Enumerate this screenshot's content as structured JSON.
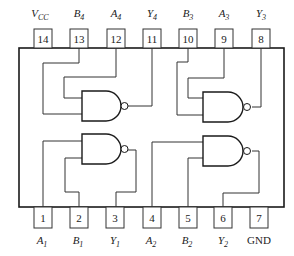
{
  "diagram": {
    "type": "IC pinout",
    "top_pins": [
      {
        "num": "14",
        "label": "V",
        "sub": "CC",
        "italic": true
      },
      {
        "num": "13",
        "label": "B",
        "sub": "4",
        "italic": true
      },
      {
        "num": "12",
        "label": "A",
        "sub": "4",
        "italic": true
      },
      {
        "num": "11",
        "label": "Y",
        "sub": "4",
        "italic": true
      },
      {
        "num": "10",
        "label": "B",
        "sub": "3",
        "italic": true
      },
      {
        "num": "9",
        "label": "A",
        "sub": "3",
        "italic": true
      },
      {
        "num": "8",
        "label": "Y",
        "sub": "3",
        "italic": true
      }
    ],
    "bottom_pins": [
      {
        "num": "1",
        "label": "A",
        "sub": "1",
        "italic": true
      },
      {
        "num": "2",
        "label": "B",
        "sub": "1",
        "italic": true
      },
      {
        "num": "3",
        "label": "Y",
        "sub": "1",
        "italic": true
      },
      {
        "num": "4",
        "label": "A",
        "sub": "2",
        "italic": true
      },
      {
        "num": "5",
        "label": "B",
        "sub": "2",
        "italic": true
      },
      {
        "num": "6",
        "label": "Y",
        "sub": "2",
        "italic": true
      },
      {
        "num": "7",
        "label": "GND",
        "sub": "",
        "italic": false
      }
    ],
    "gates": [
      {
        "id": "gate-1",
        "type": "NAND",
        "inputs": [
          "1",
          "2"
        ],
        "output": "3"
      },
      {
        "id": "gate-2",
        "type": "NAND",
        "inputs": [
          "4",
          "5"
        ],
        "output": "6"
      },
      {
        "id": "gate-3",
        "type": "NAND",
        "inputs": [
          "9",
          "10"
        ],
        "output": "8"
      },
      {
        "id": "gate-4",
        "type": "NAND",
        "inputs": [
          "12",
          "13"
        ],
        "output": "11"
      }
    ],
    "colors": {
      "line": "#333333",
      "background": "#ffffff"
    }
  }
}
